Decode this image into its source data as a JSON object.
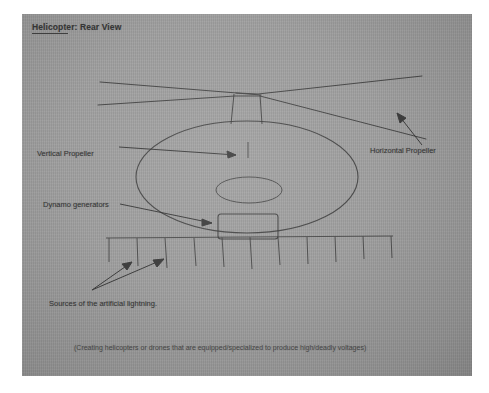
{
  "document": {
    "title": "Helicopter: Rear View",
    "title_underlined_part": "Helicopter:",
    "caption": "(Creating helicopters or drones that are equipped/specialized to produce high/deadly voltages)"
  },
  "labels": {
    "vertical_propeller": "Vertical Propeller",
    "horizontal_propeller": "Horizontal Propeller",
    "dynamo_generators": "Dynamo generators",
    "lightning_sources": "Sources of the artificial lightning."
  },
  "colors": {
    "paper": "#9c9c9c",
    "ink": "#2b2b2b",
    "page_background": "#ffffff"
  },
  "diagram": {
    "type": "hand-drawn-sketch",
    "parts": [
      {
        "name": "main-rotor-blades",
        "count": 2,
        "shape": "long crossing straight lines"
      },
      {
        "name": "rotor-mast",
        "count": 1,
        "shape": "narrow vertical rectangle"
      },
      {
        "name": "fuselage-body",
        "count": 1,
        "shape": "large ellipse"
      },
      {
        "name": "vertical-propeller",
        "count": 1,
        "shape": "small ellipse inside body"
      },
      {
        "name": "dynamo-generator-box",
        "count": 1,
        "shape": "rounded rectangle inside body"
      },
      {
        "name": "electrode-rake",
        "count": 1,
        "prongs": 11,
        "shape": "horizontal bar with downward prongs"
      },
      {
        "name": "pointer-arrows",
        "count": 5
      }
    ]
  }
}
